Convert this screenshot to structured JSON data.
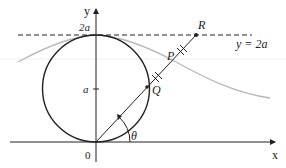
{
  "diagram": {
    "axes": {
      "x_label": "x",
      "y_label": "y",
      "origin_label": "0"
    },
    "ticks": {
      "a_label": "a",
      "two_a_label": "2a"
    },
    "line_label": "y = 2a",
    "points": {
      "P": "P",
      "Q": "Q",
      "R": "R"
    },
    "angle_label": "θ",
    "colors": {
      "stroke": "#222222",
      "curve": "#b8b8b8",
      "background": "#ffffff"
    }
  }
}
